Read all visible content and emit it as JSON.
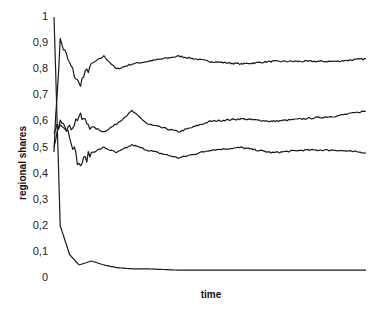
{
  "chart_data": {
    "type": "line",
    "title": "",
    "xlabel": "time",
    "ylabel": "regional shares",
    "ylim": [
      0,
      1
    ],
    "yticks": [
      "0",
      "0,1",
      "0,2",
      "0,3",
      "0,4",
      "0,5",
      "0,6",
      "0,7",
      "0,8",
      "0,9",
      "1"
    ],
    "xticks": [],
    "grid": false,
    "legend": null,
    "x": [
      0,
      2,
      5,
      8,
      12,
      16,
      20,
      25,
      30,
      40,
      50,
      60,
      70,
      80,
      90,
      100
    ],
    "series": [
      {
        "name": "region 1",
        "values": [
          0.5,
          0.91,
          0.82,
          0.74,
          0.82,
          0.85,
          0.8,
          0.82,
          0.83,
          0.85,
          0.83,
          0.82,
          0.83,
          0.83,
          0.83,
          0.84
        ]
      },
      {
        "name": "region 2",
        "values": [
          0.55,
          0.6,
          0.57,
          0.62,
          0.58,
          0.56,
          0.59,
          0.64,
          0.59,
          0.56,
          0.6,
          0.61,
          0.6,
          0.61,
          0.62,
          0.64
        ]
      },
      {
        "name": "region 3",
        "values": [
          0.5,
          0.62,
          0.55,
          0.43,
          0.48,
          0.5,
          0.48,
          0.51,
          0.49,
          0.46,
          0.49,
          0.5,
          0.48,
          0.49,
          0.49,
          0.48
        ]
      },
      {
        "name": "region 4",
        "values": [
          1.0,
          0.2,
          0.09,
          0.05,
          0.065,
          0.05,
          0.04,
          0.035,
          0.035,
          0.03,
          0.03,
          0.03,
          0.03,
          0.03,
          0.03,
          0.03
        ]
      }
    ]
  },
  "axes": {
    "xlabel": "time",
    "ylabel": "regional shares",
    "yticks": [
      "0",
      "0,1",
      "0,2",
      "0,3",
      "0,4",
      "0,5",
      "0,6",
      "0,7",
      "0,8",
      "0,9",
      "1"
    ]
  },
  "colors": {
    "line": "#1a1a1a",
    "text": "#222222",
    "background": "#ffffff"
  }
}
